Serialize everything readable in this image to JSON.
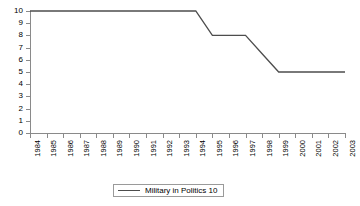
{
  "chart_data": {
    "type": "line",
    "title": "",
    "xlabel": "",
    "ylabel": "",
    "ylim": [
      0,
      10
    ],
    "yticks": [
      0,
      1,
      2,
      3,
      4,
      5,
      6,
      7,
      8,
      9,
      10
    ],
    "grid": false,
    "legend_position": "bottom-center",
    "categories": [
      "1984",
      "1985",
      "1986",
      "1987",
      "1988",
      "1989",
      "1990",
      "1991",
      "1992",
      "1993",
      "1994",
      "1995",
      "1996",
      "1997",
      "1998",
      "1999",
      "2000",
      "2001",
      "2002",
      "2003"
    ],
    "series": [
      {
        "name": "Military in Politics 10",
        "color": "#4d4d4d",
        "values": [
          10,
          10,
          10,
          10,
          10,
          10,
          10,
          10,
          10,
          10,
          10,
          8,
          8,
          8,
          6.5,
          5,
          5,
          5,
          5,
          5
        ]
      }
    ]
  },
  "legend": {
    "entries": [
      {
        "label": "Military in Politics 10"
      }
    ]
  },
  "axes": {
    "y_tick_labels": [
      "10",
      "9",
      "8",
      "7",
      "6",
      "5",
      "4",
      "3",
      "2",
      "1",
      "0"
    ],
    "x_tick_labels": [
      "1984",
      "1985",
      "1986",
      "1987",
      "1988",
      "1989",
      "1990",
      "1991",
      "1992",
      "1993",
      "1994",
      "1995",
      "1996",
      "1997",
      "1998",
      "1999",
      "2000",
      "2001",
      "2002",
      "2003"
    ]
  }
}
